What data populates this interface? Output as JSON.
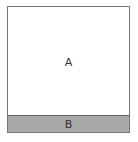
{
  "diagram": {
    "region_a": {
      "label": "A"
    },
    "region_b": {
      "label": "B",
      "fill": "#a9a9a9"
    }
  }
}
